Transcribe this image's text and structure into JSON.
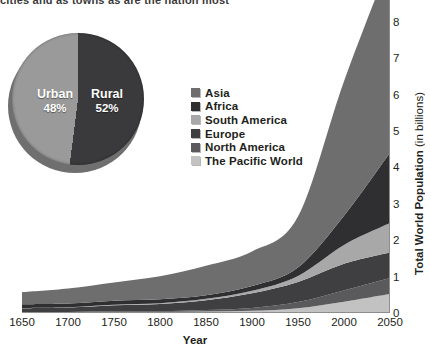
{
  "top_cut_text": "cities and as towns as are the nation most",
  "pie": {
    "name": "urban-rural-pie",
    "slices": [
      {
        "label": "Urban",
        "percent_text": "48%",
        "value": 48,
        "color": "#9a9a9a"
      },
      {
        "label": "Rural",
        "percent_text": "52%",
        "value": 52,
        "color": "#3a3a3c"
      }
    ]
  },
  "legend": {
    "items": [
      {
        "label": "Asia",
        "color": "#6e6e6e"
      },
      {
        "label": "Africa",
        "color": "#2f2f31"
      },
      {
        "label": "South America",
        "color": "#a8a8a8"
      },
      {
        "label": "Europe",
        "color": "#3f3f41"
      },
      {
        "label": "North America",
        "color": "#5a5a5c"
      },
      {
        "label": "The Pacific World",
        "color": "#c2c2c2"
      }
    ]
  },
  "chart_data": {
    "type": "area",
    "stacked": true,
    "title": "",
    "xlabel": "Year",
    "ylabel": "Total World Population (in billions)",
    "x": [
      1650,
      1700,
      1750,
      1800,
      1850,
      1900,
      1950,
      2000,
      2050
    ],
    "xlim": [
      1650,
      2050
    ],
    "ylim": [
      0,
      8.6
    ],
    "yticks": [
      0,
      1,
      2,
      3,
      4,
      5,
      6,
      7,
      8
    ],
    "xticks": [
      1650,
      1700,
      1750,
      1800,
      1850,
      1900,
      1950,
      2000,
      2050
    ],
    "grid": false,
    "legend_position": "inside-upper-center",
    "series": [
      {
        "name": "The Pacific World",
        "color": "#c2c2c2",
        "values": [
          0.02,
          0.02,
          0.03,
          0.03,
          0.04,
          0.06,
          0.13,
          0.31,
          0.52
        ]
      },
      {
        "name": "North America",
        "color": "#5a5a5c",
        "values": [
          0.01,
          0.01,
          0.02,
          0.02,
          0.04,
          0.08,
          0.17,
          0.31,
          0.44
        ]
      },
      {
        "name": "Europe",
        "color": "#3f3f41",
        "values": [
          0.1,
          0.12,
          0.16,
          0.2,
          0.27,
          0.4,
          0.55,
          0.73,
          0.7
        ]
      },
      {
        "name": "South America",
        "color": "#a8a8a8",
        "values": [
          0.01,
          0.01,
          0.02,
          0.02,
          0.04,
          0.07,
          0.17,
          0.52,
          0.81
        ]
      },
      {
        "name": "Africa",
        "color": "#2f2f31",
        "values": [
          0.1,
          0.1,
          0.11,
          0.11,
          0.1,
          0.13,
          0.23,
          0.8,
          1.93
        ]
      },
      {
        "name": "Asia",
        "color": "#6e6e6e",
        "values": [
          0.33,
          0.41,
          0.5,
          0.63,
          0.81,
          0.95,
          1.4,
          3.7,
          5.27
        ]
      }
    ]
  },
  "axis_right": {
    "ylabel_main": "Total World Population ",
    "ylabel_sub": "(in billions)"
  }
}
